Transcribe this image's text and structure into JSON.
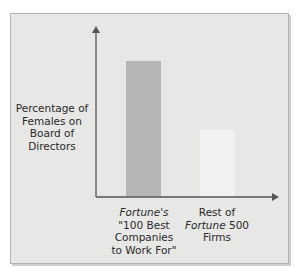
{
  "chart_data": {
    "type": "bar",
    "title": "",
    "ylabel": "Percentage of Females on Board of Directors",
    "xlabel": "",
    "categories": [
      "Fortune's \"100 Best Companies to Work For\"",
      "Rest of Fortune 500 Firms"
    ],
    "category_lines": [
      [
        {
          "text": "Fortune's",
          "italic": true
        },
        {
          "text": "\"100 Best",
          "italic": false
        },
        {
          "text": "Companies",
          "italic": false
        },
        {
          "text": "to Work For\"",
          "italic": false
        }
      ],
      [
        {
          "text": "Rest of",
          "italic": false
        },
        {
          "text": "Fortune 500",
          "italic_word": "Fortune"
        },
        {
          "text": "Firms",
          "italic": false
        }
      ]
    ],
    "values": [
      0.83,
      0.41
    ],
    "value_units": "relative (no numeric axis shown)",
    "ylim": [
      0,
      1
    ],
    "grid": false,
    "legend": "none",
    "colors": {
      "bar_1": "#b6b6b6",
      "bar_2": "#f1f1f1",
      "axis": "#555555",
      "background": "#e7e7e6"
    }
  }
}
